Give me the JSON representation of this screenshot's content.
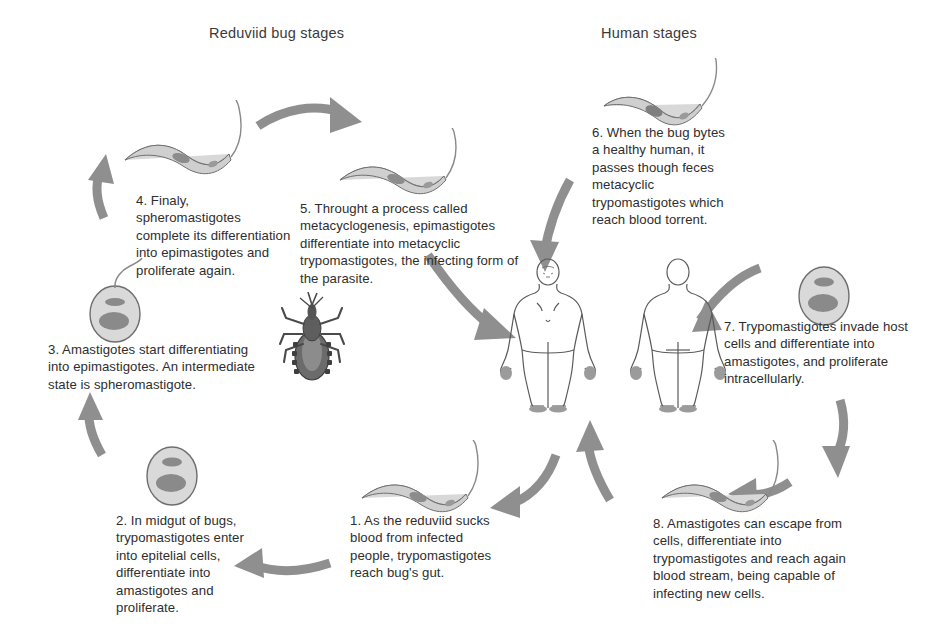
{
  "figure": {
    "title_left": "Reduviid bug stages",
    "title_right": "Human stages",
    "arrow_color": "#8f8f8f",
    "text_color": "#2e2e2e",
    "background": "#ffffff"
  },
  "steps": [
    {
      "id": 1,
      "side": "vector",
      "text": "1. As the reduviid sucks blood from infected people, trypomastigotes reach bug's gut."
    },
    {
      "id": 2,
      "side": "vector",
      "text": "2. In midgut of bugs, trypomastigotes enter into epitelial cells, differentiate into amastigotes and proliferate."
    },
    {
      "id": 3,
      "side": "vector",
      "text": "3. Amastigotes start differentiating into epimastigotes. An intermediate state is spheromastigote."
    },
    {
      "id": 4,
      "side": "vector",
      "text": "4. Finaly, spheromastigotes complete its differentiation into epimastigotes and proliferate again."
    },
    {
      "id": 5,
      "side": "vector",
      "text": "5. Throught a process called metacyclogenesis, epimastigotes differentiate into metacyclic trypomastigotes, the infecting form of the parasite."
    },
    {
      "id": 6,
      "side": "human",
      "text": "6. When the bug bytes a healthy human, it passes though feces metacyclic trypomastigotes which reach blood torrent."
    },
    {
      "id": 7,
      "side": "human",
      "text": "7. Trypomastigotes invade host cells and differentiate into amastigotes, and proliferate intracellularly."
    },
    {
      "id": 8,
      "side": "human",
      "text": "8. Amastigotes can escape from cells, differentiate into trypomastigotes and reach again blood stream, being capable of infecting new cells."
    }
  ],
  "organisms": [
    {
      "name": "epimastigote-stage-4",
      "label": "epimastigote"
    },
    {
      "name": "epimastigote-stage-5",
      "label": "epimastigote"
    },
    {
      "name": "spheromastigote-stage-3",
      "label": "spheromastigote"
    },
    {
      "name": "amastigote-stage-2",
      "label": "amastigote"
    },
    {
      "name": "trypomastigote-stage-1",
      "label": "trypomastigote"
    },
    {
      "name": "metacyclic-trypomastigote-stage-6",
      "label": "metacyclic trypomastigote"
    },
    {
      "name": "amastigote-stage-7",
      "label": "amastigote"
    },
    {
      "name": "trypomastigote-stage-8",
      "label": "trypomastigote"
    },
    {
      "name": "reduviid-bug",
      "label": "reduviid bug"
    },
    {
      "name": "human-anterior",
      "label": "human front view"
    },
    {
      "name": "human-posterior",
      "label": "human back view"
    }
  ]
}
